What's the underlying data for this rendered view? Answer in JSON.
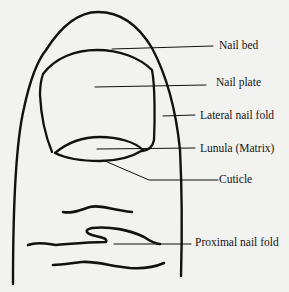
{
  "diagram": {
    "labels": [
      {
        "id": "nail-bed",
        "text": "Nail bed",
        "x": 219,
        "y": 39
      },
      {
        "id": "nail-plate",
        "text": "Nail plate",
        "x": 216,
        "y": 76
      },
      {
        "id": "lateral-nail-fold",
        "text": "Lateral nail fold",
        "x": 200,
        "y": 109
      },
      {
        "id": "lunula",
        "text": "Lunula (Matrix)",
        "x": 200,
        "y": 142
      },
      {
        "id": "cuticle",
        "text": "Cuticle",
        "x": 219,
        "y": 173
      },
      {
        "id": "proximal-nail-fold",
        "text": "Proximal nail fold",
        "x": 195,
        "y": 236
      }
    ],
    "colors": {
      "ink": "#111111",
      "paper": "#f2f2f0"
    }
  }
}
